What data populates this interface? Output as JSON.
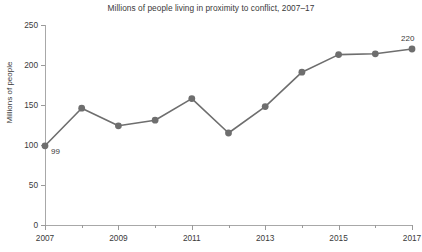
{
  "chart_data": {
    "type": "line",
    "title": "Millions of people living in proximity to conflict, 2007–17",
    "xlabel": "",
    "ylabel": "Millions of people",
    "x": [
      2007,
      2008,
      2009,
      2010,
      2011,
      2012,
      2013,
      2014,
      2015,
      2016,
      2017
    ],
    "values": [
      99,
      146,
      124,
      131,
      158,
      115,
      148,
      191,
      213,
      214,
      220
    ],
    "series": [
      {
        "name": "Millions of people living in proximity to conflict",
        "values": [
          99,
          146,
          124,
          131,
          158,
          115,
          148,
          191,
          213,
          214,
          220
        ]
      }
    ],
    "point_labels": [
      {
        "index": 0,
        "text": "99"
      },
      {
        "index": 10,
        "text": "220"
      }
    ],
    "ylim": [
      0,
      250
    ],
    "ytick_labels": [
      "250",
      "200",
      "150",
      "100",
      "50",
      "0"
    ],
    "ytick_values": [
      250,
      200,
      150,
      100,
      50,
      0
    ],
    "xtick_labels": [
      "2007",
      "2009",
      "2011",
      "2013",
      "2015",
      "2017"
    ],
    "xtick_values": [
      2007,
      2009,
      2011,
      2013,
      2015,
      2017
    ],
    "xlim": [
      2007,
      2017
    ],
    "grid": false,
    "legend": "none",
    "line_color": "#6e6e6e",
    "marker_color": "#6e6e6e",
    "axis_color": "#a8a8a8",
    "text_color": "#3a3a3a",
    "background_color": "#ffffff"
  }
}
